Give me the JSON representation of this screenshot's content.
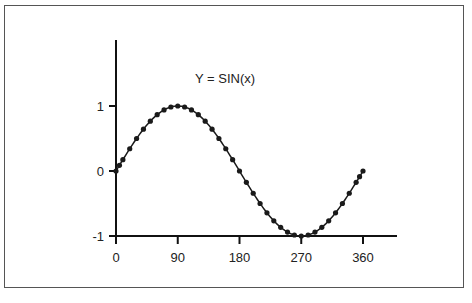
{
  "chart_data": {
    "type": "line",
    "title": "Y = SIN(x)",
    "xlabel": "",
    "ylabel": "",
    "xlim": [
      0,
      360
    ],
    "ylim": [
      -1,
      1
    ],
    "grid": false,
    "legend": null,
    "x_ticks": [
      0,
      90,
      180,
      270,
      360
    ],
    "x_tick_labels": [
      "0",
      "90",
      "180",
      "270",
      "360"
    ],
    "y_ticks": [
      -1,
      0,
      1
    ],
    "y_tick_labels": [
      "-1",
      "0",
      "1"
    ],
    "series": [
      {
        "name": "sin(x)",
        "marker": "circle",
        "x": [
          0,
          5,
          10,
          20,
          30,
          40,
          50,
          60,
          70,
          80,
          90,
          100,
          110,
          120,
          130,
          140,
          150,
          160,
          170,
          180,
          190,
          200,
          210,
          220,
          230,
          240,
          250,
          260,
          270,
          280,
          290,
          300,
          310,
          320,
          330,
          340,
          350,
          355,
          360
        ],
        "y": [
          0,
          0.087,
          0.174,
          0.342,
          0.5,
          0.643,
          0.766,
          0.866,
          0.94,
          0.985,
          1,
          0.985,
          0.94,
          0.866,
          0.766,
          0.643,
          0.5,
          0.342,
          0.174,
          0,
          -0.174,
          -0.342,
          -0.5,
          -0.643,
          -0.766,
          -0.866,
          -0.94,
          -0.985,
          -1,
          -0.985,
          -0.94,
          -0.866,
          -0.766,
          -0.643,
          -0.5,
          -0.342,
          -0.174,
          -0.087,
          0
        ]
      }
    ]
  },
  "plot": {
    "title": "Y = SIN(x)",
    "colors": {
      "line": "#1a1a1a",
      "marker": "#1a1a1a",
      "axis": "#111111",
      "frame": "#555555"
    }
  }
}
